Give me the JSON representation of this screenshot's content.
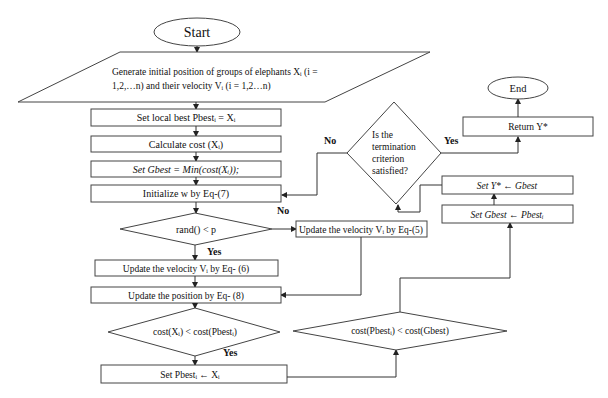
{
  "diagram": {
    "type": "flowchart",
    "terminals": {
      "start": "Start",
      "end": "End"
    },
    "nodes": {
      "init_1": "Generate initial position of groups of elephants  Xᵢ (i =",
      "init_2": "1,2,…n)  and their velocity Vᵢ (i = 1,2…n)",
      "set_local_best": "Set local best Pbestᵢ =  Xᵢ",
      "calc_cost": "Calculate cost (Xᵢ)",
      "set_gbest": "Set Gbest = Min(cost(Xᵢ));",
      "init_w": "Initialize w by Eq-(7)",
      "rand_decision": "rand() < p",
      "update_vel_5": "Update the velocity Vᵢ  by Eq-(5)",
      "update_vel_6": "Update the velocity Vᵢ  by Eq- (6)",
      "update_pos": "Update the position by Eq- (8)",
      "cost_decision_1": "cost(Xᵢ) < cost(Pbestᵢ)",
      "set_pbest": "Set Pbestᵢ  ← Xᵢ",
      "cost_decision_2": "cost(Pbestᵢ) < cost(Gbest)",
      "set_gbest_pbest": "Set Gbest ←  Pbestᵢ",
      "set_ystar": "Set Y* ← Gbest",
      "termination_1": "Is the",
      "termination_2": "termination",
      "termination_3": "criterion",
      "termination_4": "satisfied?",
      "return_ystar": "Return Y*"
    },
    "edge_labels": {
      "term_no": "No",
      "term_yes": "Yes",
      "rand_no": "No",
      "rand_yes": "Yes",
      "cost1_yes": "Yes"
    }
  }
}
